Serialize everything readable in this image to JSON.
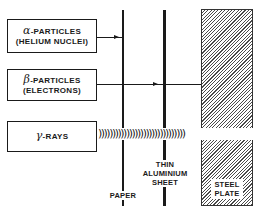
{
  "diagram": {
    "type": "radiation-penetration",
    "sources": [
      {
        "symbol": "α",
        "line1": "-PARTICLES",
        "line2": "(HELIUM NUCLEI)",
        "stopped_by": "paper"
      },
      {
        "symbol": "β",
        "line1": "-PARTICLES",
        "line2": "(ELECTRONS)",
        "stopped_by": "thin aluminium sheet"
      },
      {
        "symbol": "γ",
        "line1": "-RAYS",
        "line2": "",
        "stopped_by": "none"
      }
    ],
    "barriers": {
      "paper": {
        "label": "PAPER"
      },
      "aluminium": {
        "label_lines": [
          "THIN",
          "ALUMINIUM",
          "SHEET"
        ]
      },
      "steel": {
        "label_lines": [
          "STEEL",
          "PLATE"
        ]
      }
    },
    "wave_glyphs": ")))))))))))))))))))))))))))))))",
    "colors": {
      "ink": "#1a1a1a",
      "background": "#ffffff"
    }
  }
}
